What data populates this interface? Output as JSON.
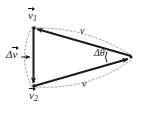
{
  "figure": {
    "background_color": "#ffffff",
    "line_color": "#1a1a1a",
    "dash_color": "#9a9a9a",
    "labels": {
      "v1": "v",
      "v1_sub": "1",
      "v2": "v",
      "v2_sub": "2",
      "delta_v_symbol": "Δ",
      "delta_v_vec": "v",
      "delta_theta": "Δθ",
      "arc_top_speed": "v",
      "arc_bottom_speed": "v"
    }
  },
  "geometry": {
    "apex": {
      "x": 132,
      "y": 57
    },
    "top_left": {
      "x": 33,
      "y": 28
    },
    "bottom_left": {
      "x": 33,
      "y": 86
    },
    "arc_top_bulge": {
      "x": 86,
      "y": 33
    },
    "arc_bottom_bulge": {
      "x": 86,
      "y": 84
    },
    "arc_left_bulge": {
      "x": 17,
      "y": 57
    },
    "angle_arc_radius": 26
  }
}
